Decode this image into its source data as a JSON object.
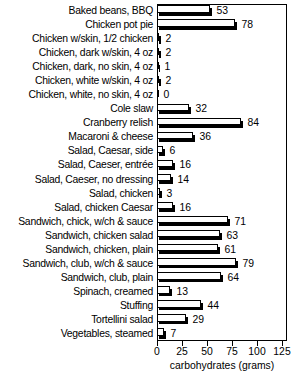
{
  "chart_data": {
    "type": "bar",
    "orientation": "horizontal",
    "title": "",
    "xlabel": "carbohydrates (grams)",
    "ylabel": "",
    "xlim": [
      0,
      130
    ],
    "xticks": [
      0,
      25,
      50,
      75,
      100,
      125
    ],
    "xtick_labels": [
      "0",
      "25",
      "50",
      "75",
      "100",
      "125"
    ],
    "grid": false,
    "legend": null,
    "value_labels": true,
    "bar_style": "hollow-outline-with-drop-shadow",
    "categories": [
      "Baked beans, BBQ",
      "Chicken pot pie",
      "Chicken w/skin, 1/2 chicken",
      "Chicken, dark w/skin, 4 oz",
      "Chicken, dark, no skin, 4 oz",
      "Chicken, white w/skin, 4 oz",
      "Chicken, white, no skin, 4 oz",
      "Cole slaw",
      "Cranberry relish",
      "Macaroni & cheese",
      "Salad, Caesar, side",
      "Salad, Caeser, entrée",
      "Salad, Caeser, no dressing",
      "Salad, chicken",
      "Salad, chicken Caesar",
      "Sandwich, chick, w/ch & sauce",
      "Sandwich, chicken salad",
      "Sandwich, chicken, plain",
      "Sandwich, club, w/ch & sauce",
      "Sandwich, club, plain",
      "Spinach, creamed",
      "Stuffing",
      "Tortellini salad",
      "Vegetables, steamed"
    ],
    "values": [
      53,
      78,
      2,
      2,
      1,
      2,
      0,
      32,
      84,
      36,
      6,
      16,
      14,
      3,
      16,
      71,
      63,
      61,
      79,
      64,
      13,
      44,
      29,
      7
    ],
    "value_label_texts": [
      "53",
      "78",
      "2",
      "2",
      "1",
      "2",
      "0",
      "32",
      "84",
      "36",
      "6",
      "16",
      "14",
      "3",
      "16",
      "71",
      "63",
      "61",
      "79",
      "64",
      "13",
      "44",
      "29",
      "7"
    ]
  },
  "axis": {
    "x_title": "carbohydrates (grams)"
  }
}
